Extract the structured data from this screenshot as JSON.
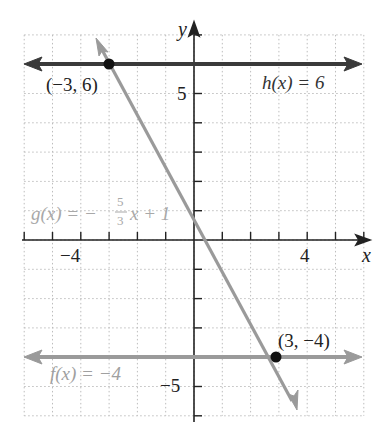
{
  "chart_data": {
    "type": "line",
    "title": "",
    "xlabel": "x",
    "ylabel": "y",
    "xlim": [
      -6,
      6
    ],
    "ylim": [
      -6,
      7
    ],
    "grid": true,
    "grid_style": "dotted",
    "x_tick_labels": [
      {
        "value": -4,
        "label": "−4"
      },
      {
        "value": 4,
        "label": "4"
      }
    ],
    "y_tick_labels": [
      {
        "value": 5,
        "label": "5"
      },
      {
        "value": -5,
        "label": "−5"
      }
    ],
    "series": [
      {
        "name": "h(x) = 6",
        "kind": "horizontal",
        "y": 6,
        "color": "#3a3a3a",
        "x_range": [
          -6,
          6
        ]
      },
      {
        "name": "g(x) = −5/3 x + 1",
        "kind": "linear",
        "slope": -1.6667,
        "intercept": 1,
        "color": "#9a9a9a",
        "x_range": [
          -3.4,
          4.3
        ]
      },
      {
        "name": "f(x) = −4",
        "kind": "horizontal",
        "y": -4,
        "color": "#9a9a9a",
        "x_range": [
          -6,
          6
        ]
      }
    ],
    "points": [
      {
        "x": -3,
        "y": 6,
        "label": "(−3, 6)"
      },
      {
        "x": 3,
        "y": -4,
        "label": "(3, −4)"
      }
    ],
    "annotations": {
      "h_label": "h(x) = 6",
      "g_label_prefix": "g(x) = −",
      "g_frac_num": "5",
      "g_frac_den": "3",
      "g_label_suffix": "x + 1",
      "f_label": "f(x) = −4",
      "point1_label": "(−3, 6)",
      "point2_label": "(3, −4)",
      "x_axis_label": "x",
      "y_axis_label": "y",
      "tick_neg4": "−4",
      "tick_4": "4",
      "tick_5": "5",
      "tick_neg5": "−5"
    }
  }
}
